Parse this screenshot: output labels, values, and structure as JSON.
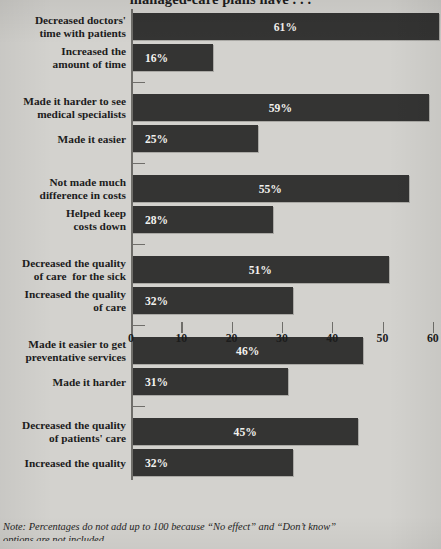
{
  "chart": {
    "title": "managed-care plans have . . .",
    "footnote_line1": "Note: Percentages do not add up to 100 because “No effect” and “Don’t know”",
    "footnote_line2": "options are not included.",
    "colors": {
      "background": "#d3d2ce",
      "bar": "#343433",
      "axis": "#6f6e6a",
      "text": "#1c1c1c",
      "value_text": "#f2f1ee"
    }
  },
  "chart_data": {
    "type": "bar",
    "orientation": "horizontal",
    "title": "managed-care plans have . . .",
    "xlabel": "",
    "ylabel": "",
    "xlim": [
      0,
      62
    ],
    "grid": true,
    "legend": null,
    "xticks": [
      0,
      10,
      20,
      30,
      40,
      50,
      60
    ],
    "xtick_labels": [
      "0",
      "10",
      "20",
      "30",
      "40",
      "50",
      "60"
    ],
    "value_suffix": "%",
    "groups": [
      {
        "bars": [
          {
            "label": "Decreased doctors'\ntime with patients",
            "value": 61,
            "value_label": "61%"
          },
          {
            "label": "Increased the\namount of time",
            "value": 16,
            "value_label": "16%"
          }
        ]
      },
      {
        "bars": [
          {
            "label": "Made it harder to see\nmedical specialists",
            "value": 59,
            "value_label": "59%"
          },
          {
            "label": "Made it easier",
            "value": 25,
            "value_label": "25%"
          }
        ]
      },
      {
        "bars": [
          {
            "label": "Not made much\ndifference in costs",
            "value": 55,
            "value_label": "55%"
          },
          {
            "label": "Helped keep\ncosts down",
            "value": 28,
            "value_label": "28%"
          }
        ]
      },
      {
        "bars": [
          {
            "label": "Decreased the quality\nof care  for the sick",
            "value": 51,
            "value_label": "51%"
          },
          {
            "label": "Increased the quality\nof care",
            "value": 32,
            "value_label": "32%"
          }
        ]
      },
      {
        "bars": [
          {
            "label": "Made it easier to get\npreventative services",
            "value": 46,
            "value_label": "46%"
          },
          {
            "label": "Made it harder",
            "value": 31,
            "value_label": "31%"
          }
        ]
      },
      {
        "bars": [
          {
            "label": "Decreased the quality\nof patients' care",
            "value": 45,
            "value_label": "45%"
          },
          {
            "label": "Increased the quality",
            "value": 32,
            "value_label": "32%"
          }
        ]
      }
    ]
  }
}
